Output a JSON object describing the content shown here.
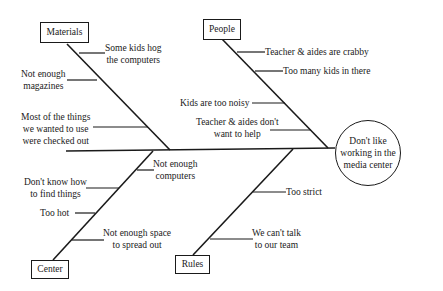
{
  "diagram": {
    "type": "fishbone",
    "effect": "Don't like\nworking in the\nmedia center",
    "categories": [
      {
        "name": "Materials",
        "causes": [
          "Some kids hog\nthe computers",
          "Not enough\nmagazines",
          "Most of the things\nwe wanted to use\nwere checked out"
        ]
      },
      {
        "name": "People",
        "causes": [
          "Teacher & aides are crabby",
          "Too many kids in there",
          "Kids are too noisy",
          "Teacher & aides don't\nwant to help"
        ]
      },
      {
        "name": "Center",
        "causes": [
          "Not enough\ncomputers",
          "Don't know how\nto find things",
          "Too hot",
          "Not enough space\nto spread out"
        ]
      },
      {
        "name": "Rules",
        "causes": [
          "Too strict",
          "We can't talk\nto our team"
        ]
      }
    ]
  }
}
